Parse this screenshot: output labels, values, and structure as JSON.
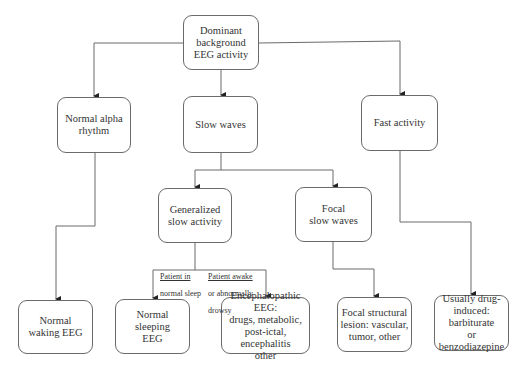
{
  "diagram": {
    "type": "flowchart",
    "nodes": {
      "root": "Dominant\nbackground\nEEG activity",
      "alpha": "Normal alpha\nrhythm",
      "slow": "Slow waves",
      "fast": "Fast activity",
      "generalized": "Generalized\nslow activity",
      "focal": "Focal\nslow waves",
      "waking": "Normal\nwaking EEG",
      "sleeping": "Normal sleeping\nEEG",
      "encephalopathic": "Encephalopathic EEG:\ndrugs, metabolic,\npost-ictal, encephalitis\nother",
      "structural": "Focal structural\nlesion: vascular,\ntumor, other",
      "drug": "Usually drug-\ninduced: barbiturate\nor benzodiazepine"
    },
    "edge_labels": {
      "sleep_line1": "Patient in",
      "sleep_line2": "normal sleep",
      "awake_line1": "Patient awake",
      "awake_line2": "or abnormally",
      "awake_line3": "drowsy"
    },
    "edges": [
      [
        "root",
        "alpha"
      ],
      [
        "root",
        "slow"
      ],
      [
        "root",
        "fast"
      ],
      [
        "alpha",
        "waking"
      ],
      [
        "slow",
        "generalized"
      ],
      [
        "slow",
        "focal"
      ],
      [
        "generalized",
        "sleeping"
      ],
      [
        "generalized",
        "encephalopathic"
      ],
      [
        "focal",
        "structural"
      ],
      [
        "fast",
        "drug"
      ]
    ]
  }
}
